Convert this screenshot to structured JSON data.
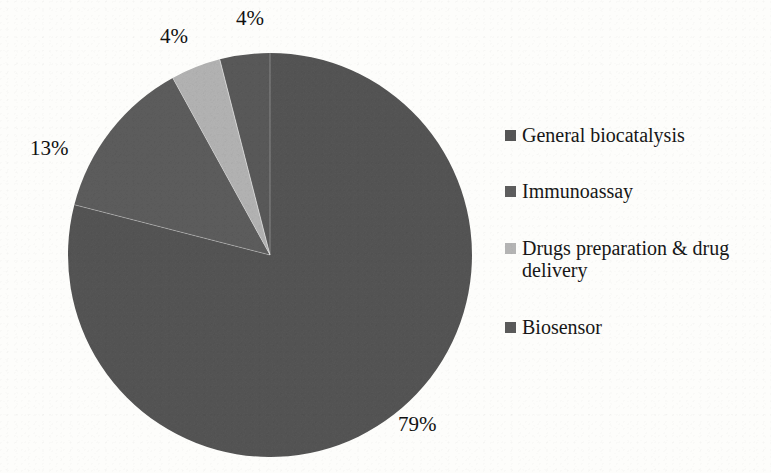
{
  "chart_data": {
    "type": "pie",
    "title": "",
    "categories": [
      "General biocatalysis",
      "Immunoassay",
      "Drugs preparation & drug delivery",
      "Biosensor"
    ],
    "values": [
      79,
      13,
      4,
      4
    ],
    "value_labels": [
      "79%",
      "13%",
      "4%",
      "4%"
    ],
    "unit": "%",
    "legend_position": "right",
    "grid": false,
    "start_angle_deg": 0,
    "direction": "clockwise",
    "colors": [
      "#555555",
      "#5d5d5d",
      "#b4b4b4",
      "#5a5a5a"
    ]
  },
  "slices": [
    {
      "name": "General biocatalysis",
      "value": 79,
      "label": "79%",
      "color": "#555555",
      "start_deg": 0,
      "end_deg": 284.4
    },
    {
      "name": "Immunoassay",
      "value": 13,
      "label": "13%",
      "color": "#5d5d5d",
      "start_deg": 284.4,
      "end_deg": 331.2
    },
    {
      "name": "Drugs preparation & drug delivery",
      "value": 4,
      "label": "4%",
      "color": "#b4b4b4",
      "start_deg": 331.2,
      "end_deg": 345.6
    },
    {
      "name": "Biosensor",
      "value": 4,
      "label": "4%",
      "color": "#5a5a5a",
      "start_deg": 345.6,
      "end_deg": 360
    }
  ],
  "labels": {
    "general": "79%",
    "immunoassay": "13%",
    "drugs": "4%",
    "biosensor": "4%"
  },
  "legend": {
    "items": [
      {
        "label": "General biocatalysis",
        "color": "#555555"
      },
      {
        "label": "Immunoassay",
        "color": "#5d5d5d"
      },
      {
        "label": "Drugs preparation & drug delivery",
        "color": "#b4b4b4"
      },
      {
        "label": "Biosensor",
        "color": "#5a5a5a"
      }
    ]
  }
}
